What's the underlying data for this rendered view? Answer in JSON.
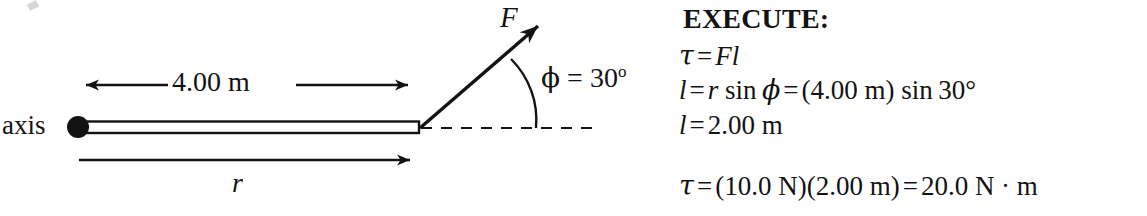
{
  "figure": {
    "type": "physics-free-body-diagram",
    "background_color": "#ffffff",
    "ink_color": "#131313",
    "axis_label": "axis",
    "dimension_label": "4.00 m",
    "position_vector_label": "r",
    "force_label": "F",
    "angle_symbol": "ϕ",
    "angle_equals": " = 30",
    "angle_superscript": "o",
    "rod": {
      "pivot_x": 78,
      "pivot_y": 127,
      "pivot_radius": 11,
      "end_x": 419,
      "end_y": 127,
      "half_thickness": 5
    },
    "force_arrow": {
      "tail_x": 420,
      "tail_y": 128,
      "tip_x": 546,
      "tip_y": 19,
      "angle_degrees": 30
    },
    "dashed_reference_line": {
      "start_x": 420,
      "end_x": 596,
      "y": 128
    },
    "angle_arc": {
      "start_x": 511,
      "start_y": 59,
      "end_x": 536,
      "end_y": 128
    },
    "dimension_arrow": {
      "start_x": 73,
      "end_x": 421,
      "y": 85,
      "double_headed": true
    },
    "position_arrow": {
      "start_x": 79,
      "end_x": 421,
      "y": 160,
      "double_headed": false
    }
  },
  "solution": {
    "heading": "EXECUTE:",
    "lines": [
      {
        "id": "torque-definition",
        "parts": [
          {
            "text": "τ",
            "style": "greek-italic"
          },
          {
            "text": "=",
            "style": "operator"
          },
          {
            "text": "Fl",
            "style": "italic"
          }
        ]
      },
      {
        "id": "lever-arm-expression",
        "parts": [
          {
            "text": "l",
            "style": "italic"
          },
          {
            "text": "=",
            "style": "operator"
          },
          {
            "text": "r",
            "style": "italic"
          },
          {
            "text": " sin ",
            "style": "roman"
          },
          {
            "text": "ϕ",
            "style": "greek-italic"
          },
          {
            "text": "=",
            "style": "operator"
          },
          {
            "text": "(4.00 m) sin 30°",
            "style": "roman"
          }
        ]
      },
      {
        "id": "lever-arm-value",
        "parts": [
          {
            "text": "l",
            "style": "italic"
          },
          {
            "text": "=",
            "style": "operator"
          },
          {
            "text": "2.00 m",
            "style": "roman"
          }
        ]
      },
      {
        "id": "torque-result",
        "parts": [
          {
            "text": "τ",
            "style": "greek-italic"
          },
          {
            "text": "=",
            "style": "operator"
          },
          {
            "text": "(10.0 N)(2.00 m)",
            "style": "roman"
          },
          {
            "text": "=",
            "style": "operator"
          },
          {
            "text": "20.0 N · m",
            "style": "roman"
          }
        ]
      }
    ],
    "values": {
      "force_newtons": "10.0 N",
      "radius_meters": "4.00 m",
      "lever_arm_meters": "2.00 m",
      "angle_degrees": "30°",
      "torque_result": "20.0 N · m"
    }
  }
}
